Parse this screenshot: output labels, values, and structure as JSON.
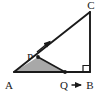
{
  "figure": {
    "background_color": "#ffffff",
    "stroke_color": "#1a1a1a",
    "shaded_fill_color": "#a8a8a8",
    "labels": {
      "A": "A",
      "B": "B",
      "C": "C",
      "P": "P",
      "Q": "Q"
    },
    "points": {
      "A": {
        "x": 14,
        "y": 72
      },
      "B": {
        "x": 90,
        "y": 72
      },
      "C": {
        "x": 90,
        "y": 12
      },
      "P": {
        "x": 38,
        "y": 57
      },
      "Q": {
        "x": 65,
        "y": 72
      }
    },
    "segments": [
      {
        "name": "base-AB",
        "from": "A",
        "to": "B"
      },
      {
        "name": "vertical-BC",
        "from": "B",
        "to": "C"
      },
      {
        "name": "hypotenuse-AC",
        "from": "A",
        "to": "C"
      },
      {
        "name": "segment-PQ",
        "from": "P",
        "to": "Q"
      }
    ],
    "shaded_region": {
      "name": "triangle-APQ",
      "vertices": [
        "A",
        "P",
        "Q"
      ]
    },
    "right_angle_marker": {
      "at": "B",
      "size": 7
    },
    "velocity_arrows": [
      {
        "name": "arrow-at-P",
        "direction": "up-right along hypotenuse AC",
        "from": {
          "x": 39,
          "y": 53
        },
        "to": {
          "x": 52,
          "y": 40
        }
      },
      {
        "name": "arrow-at-Q",
        "direction": "right along base AB",
        "from": {
          "x": 71,
          "y": 85
        },
        "to": {
          "x": 83,
          "y": 85
        }
      }
    ]
  }
}
